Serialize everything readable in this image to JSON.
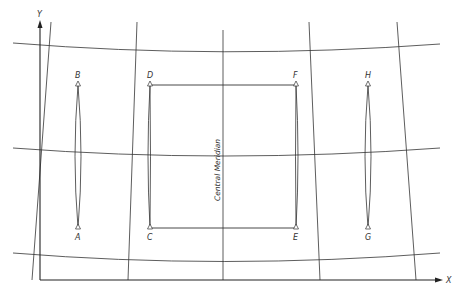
{
  "diagram": {
    "type": "map-projection-grid",
    "axes": {
      "x_label": "X",
      "y_label": "Y"
    },
    "central_meridian_label": "Central Meridian",
    "points": [
      {
        "id": "A",
        "x": 78,
        "y": 228
      },
      {
        "id": "B",
        "x": 78,
        "y": 85
      },
      {
        "id": "C",
        "x": 150,
        "y": 228
      },
      {
        "id": "D",
        "x": 150,
        "y": 85
      },
      {
        "id": "E",
        "x": 296,
        "y": 228
      },
      {
        "id": "F",
        "x": 296,
        "y": 85
      },
      {
        "id": "G",
        "x": 368,
        "y": 228
      },
      {
        "id": "H",
        "x": 368,
        "y": 85
      }
    ],
    "connections": [
      {
        "from": "A",
        "to": "B",
        "style": "lens"
      },
      {
        "from": "C",
        "to": "D",
        "style": "lens"
      },
      {
        "from": "E",
        "to": "F",
        "style": "lens"
      },
      {
        "from": "G",
        "to": "H",
        "style": "lens"
      },
      {
        "from": "D",
        "to": "F",
        "style": "straight"
      },
      {
        "from": "C",
        "to": "E",
        "style": "straight"
      }
    ],
    "parallels_count": 3,
    "meridians_count": 5
  }
}
